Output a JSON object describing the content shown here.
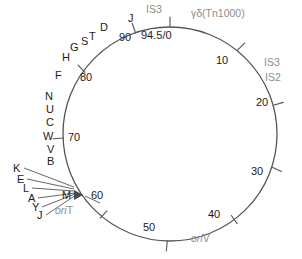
{
  "figure": {
    "type": "circular-genetic-map",
    "title": "",
    "circle": {
      "cx": 170,
      "cy": 134,
      "r": 107,
      "stroke": "#555555"
    },
    "scale_total": "94.5",
    "colors": {
      "gene_label": "#1b1b1b",
      "feature_label": "#8d8d8d",
      "line": "#555555",
      "background": "#ffffff"
    }
  },
  "coordinates": [
    {
      "label": "94.5/0",
      "x": 154,
      "y": 36,
      "tick": true
    },
    {
      "label": "90",
      "x": 126,
      "y": 38,
      "tick": true
    },
    {
      "label": "10",
      "x": 221,
      "y": 61,
      "tick": true
    },
    {
      "label": "20",
      "x": 252,
      "y": 112,
      "tick": true
    },
    {
      "label": "30",
      "x": 248,
      "y": 173,
      "tick": true
    },
    {
      "label": "40",
      "x": 204,
      "y": 214,
      "tick": true
    },
    {
      "label": "50",
      "x": 142,
      "y": 224,
      "tick": true
    },
    {
      "label": "60",
      "x": 92,
      "y": 197,
      "tick": true
    },
    {
      "label": "70",
      "x": 68,
      "y": 136,
      "tick": true
    },
    {
      "label": "80",
      "x": 79,
      "y": 76,
      "tick": true
    }
  ],
  "gene_labels": [
    {
      "label": "J",
      "x": 129,
      "y": 18
    },
    {
      "label": "D",
      "x": 101,
      "y": 27
    },
    {
      "label": "T",
      "x": 89,
      "y": 37
    },
    {
      "label": "S",
      "x": 81,
      "y": 41
    },
    {
      "label": "G",
      "x": 71,
      "y": 46
    },
    {
      "label": "H",
      "x": 63,
      "y": 57
    },
    {
      "label": "F",
      "x": 55,
      "y": 75
    },
    {
      "label": "N",
      "x": 46,
      "y": 96
    },
    {
      "label": "U",
      "x": 46,
      "y": 110
    },
    {
      "label": "C",
      "x": 46,
      "y": 123
    },
    {
      "label": "W",
      "x": 44,
      "y": 136
    },
    {
      "label": "V",
      "x": 46,
      "y": 149
    },
    {
      "label": "B",
      "x": 48,
      "y": 161
    },
    {
      "label": "K",
      "x": 13,
      "y": 168
    },
    {
      "label": "E",
      "x": 17,
      "y": 180
    },
    {
      "label": "L",
      "x": 22,
      "y": 190
    },
    {
      "label": "A",
      "x": 28,
      "y": 199
    },
    {
      "label": "Y",
      "x": 32,
      "y": 209
    },
    {
      "label": "J",
      "x": 36,
      "y": 216
    },
    {
      "label": "M",
      "x": 64,
      "y": 196
    }
  ],
  "feature_labels": [
    {
      "label": "IS3",
      "x": 146,
      "y": 7
    },
    {
      "label": "γδ(Tn1000)",
      "x": 191,
      "y": 11
    },
    {
      "label": "IS3",
      "x": 264,
      "y": 62
    },
    {
      "label": "IS2",
      "x": 264,
      "y": 77
    }
  ],
  "origin_labels": [
    {
      "id": "oriT",
      "prefix": "ori",
      "suffix": "T",
      "x": 58,
      "y": 210
    },
    {
      "id": "oriV",
      "prefix": "ori",
      "suffix": "V",
      "x": 193,
      "y": 238
    }
  ],
  "leader_lines": {
    "converge_x": 74,
    "converge_y": 194,
    "sources": [
      {
        "gene": "K",
        "x": 24,
        "y": 170
      },
      {
        "gene": "E",
        "x": 27,
        "y": 181
      },
      {
        "gene": "L",
        "x": 32,
        "y": 190
      },
      {
        "gene": "A",
        "x": 38,
        "y": 200
      },
      {
        "gene": "Y",
        "x": 42,
        "y": 209
      },
      {
        "gene": "J",
        "x": 46,
        "y": 217
      }
    ]
  },
  "arrow_marker": {
    "name": "oriT-transfer-arrow",
    "x": 78,
    "y": 194,
    "direction": "right"
  }
}
